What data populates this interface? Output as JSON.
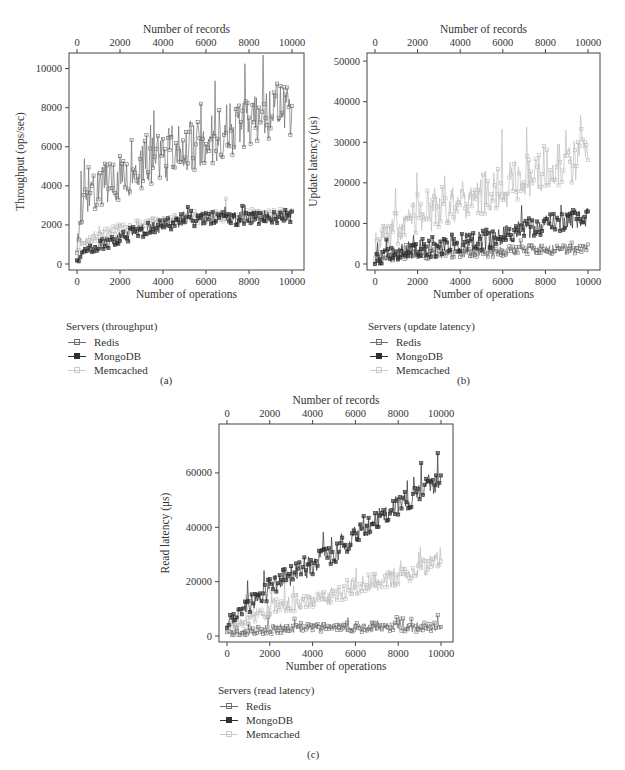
{
  "figure": {
    "colors": {
      "Redis": "#6e6e6e",
      "MongoDB": "#2f2f2f",
      "Memcached": "#bdbdbd",
      "axis": "#444444"
    }
  },
  "chart_data": [
    {
      "id": "a",
      "type": "line",
      "caption": "(a)",
      "title": "",
      "xlabel": "Number of operations",
      "x2label": "Number of records",
      "ylabel": "Throughput (ops/sec)",
      "xlim": [
        0,
        10000
      ],
      "ylim": [
        0,
        10800
      ],
      "xticks": [
        0,
        2000,
        4000,
        6000,
        8000,
        10000
      ],
      "x2ticks": [
        0,
        2000,
        4000,
        6000,
        8000,
        10000
      ],
      "yticks": [
        0,
        2000,
        4000,
        6000,
        8000,
        10000
      ],
      "grid": false,
      "legend": {
        "title": "Servers (throughput)",
        "placement": "below-left",
        "entries": [
          "Redis",
          "MongoDB",
          "Memcached"
        ]
      },
      "x": [
        0,
        100,
        250,
        500,
        1000,
        1500,
        2000,
        2500,
        3000,
        3500,
        4000,
        4500,
        5000,
        5500,
        6000,
        6500,
        7000,
        7500,
        8000,
        8500,
        9000,
        9500,
        10000
      ],
      "series": [
        {
          "name": "Redis",
          "values": [
            200,
            1500,
            2600,
            3500,
            3800,
            4200,
            4500,
            4700,
            5000,
            5200,
            5400,
            5600,
            5800,
            6000,
            6200,
            6400,
            6700,
            6900,
            7100,
            7400,
            7700,
            7900,
            7800
          ],
          "noise": 1400
        },
        {
          "name": "MongoDB",
          "values": [
            100,
            300,
            500,
            700,
            900,
            1100,
            1300,
            1500,
            1650,
            1800,
            1950,
            2100,
            2200,
            2250,
            2300,
            2300,
            2300,
            2300,
            2350,
            2350,
            2400,
            2400,
            2400
          ],
          "noise": 350
        },
        {
          "name": "Memcached",
          "values": [
            150,
            700,
            1000,
            1200,
            1400,
            1600,
            1750,
            1850,
            1950,
            2050,
            2150,
            2250,
            2300,
            2350,
            2400,
            2400,
            2450,
            2450,
            2500,
            2500,
            2550,
            2550,
            2600
          ],
          "noise": 300
        }
      ]
    },
    {
      "id": "b",
      "type": "line",
      "caption": "(b)",
      "title": "",
      "xlabel": "Number of operations",
      "x2label": "Number of records",
      "ylabel": "Update latency (μs)",
      "xlim": [
        0,
        10000
      ],
      "ylim": [
        0,
        52000
      ],
      "xticks": [
        0,
        2000,
        4000,
        6000,
        8000,
        10000
      ],
      "x2ticks": [
        0,
        2000,
        4000,
        6000,
        8000,
        10000
      ],
      "yticks": [
        0,
        10000,
        20000,
        30000,
        40000,
        50000
      ],
      "grid": false,
      "legend": {
        "title": "Servers (update latency)",
        "placement": "below-left",
        "entries": [
          "Redis",
          "MongoDB",
          "Memcached"
        ]
      },
      "x": [
        0,
        100,
        250,
        500,
        1000,
        1500,
        2000,
        2500,
        3000,
        3500,
        4000,
        4500,
        5000,
        5500,
        6000,
        6500,
        7000,
        7500,
        8000,
        8500,
        9000,
        9500,
        10000
      ],
      "series": [
        {
          "name": "Redis",
          "values": [
            500,
            800,
            1000,
            1300,
            1700,
            2000,
            2200,
            2300,
            2400,
            2500,
            2600,
            2700,
            2800,
            2900,
            3000,
            3100,
            3200,
            3300,
            3300,
            3400,
            3400,
            3500,
            3500
          ],
          "noise": 1200
        },
        {
          "name": "MongoDB",
          "values": [
            800,
            1000,
            1300,
            1800,
            2500,
            3000,
            3400,
            3800,
            4200,
            4500,
            4800,
            5200,
            5600,
            6000,
            6800,
            7500,
            8200,
            9000,
            9500,
            10000,
            10500,
            11000,
            11500
          ],
          "noise": 2500
        },
        {
          "name": "Memcached",
          "values": [
            4000,
            5000,
            5500,
            6500,
            8500,
            10000,
            11500,
            12500,
            13500,
            14500,
            15500,
            16000,
            16500,
            17500,
            18500,
            19500,
            20500,
            21500,
            22500,
            23500,
            24500,
            25500,
            26500
          ],
          "noise": 5500
        }
      ]
    },
    {
      "id": "c",
      "type": "line",
      "caption": "(c)",
      "title": "",
      "xlabel": "Number of operations",
      "x2label": "Number of records",
      "ylabel": "Read latency (μs)",
      "xlim": [
        0,
        10000
      ],
      "ylim": [
        0,
        78000
      ],
      "xticks": [
        0,
        2000,
        4000,
        6000,
        8000,
        10000
      ],
      "x2ticks": [
        0,
        2000,
        4000,
        6000,
        8000,
        10000
      ],
      "yticks": [
        0,
        20000,
        40000,
        60000
      ],
      "grid": false,
      "legend": {
        "title": "Servers (read latency)",
        "placement": "below-left",
        "entries": [
          "Redis",
          "MongoDB",
          "Memcached"
        ]
      },
      "x": [
        0,
        100,
        250,
        500,
        1000,
        1500,
        2000,
        2500,
        3000,
        3500,
        4000,
        4500,
        5000,
        5500,
        6000,
        6500,
        7000,
        7500,
        8000,
        8500,
        9000,
        9500,
        10000
      ],
      "series": [
        {
          "name": "Redis",
          "values": [
            1500,
            1000,
            1000,
            1200,
            1600,
            2000,
            2400,
            2600,
            2800,
            2900,
            3000,
            3000,
            3000,
            3000,
            3000,
            3000,
            3000,
            3000,
            3000,
            3000,
            3000,
            3000,
            3000
          ],
          "noise": 1800
        },
        {
          "name": "MongoDB",
          "values": [
            3000,
            4500,
            6000,
            8000,
            11000,
            14000,
            17000,
            20000,
            22000,
            24000,
            26000,
            28000,
            30000,
            33000,
            36000,
            40000,
            42000,
            45000,
            47000,
            50000,
            52000,
            55000,
            56000
          ],
          "noise": 4000
        },
        {
          "name": "Memcached",
          "values": [
            2500,
            3000,
            3500,
            4500,
            6000,
            7500,
            9000,
            10500,
            11500,
            12500,
            13500,
            14500,
            15500,
            16500,
            17500,
            18500,
            19500,
            20500,
            21500,
            23000,
            24500,
            26000,
            28000
          ],
          "noise": 3500
        }
      ]
    }
  ]
}
